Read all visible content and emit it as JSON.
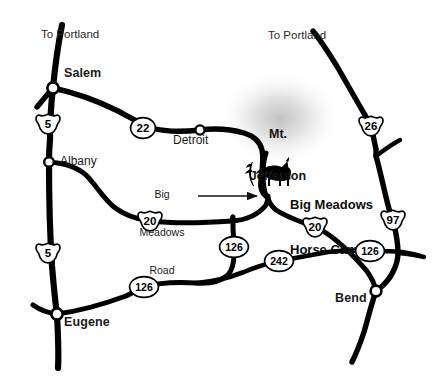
{
  "map": {
    "title": "Big Meadows Horse Camp vicinity map (Oregon)",
    "background_color": "#ffffff",
    "road_color": "#000000",
    "label_color": "#1a1a1a",
    "cities": [
      {
        "name": "Salem",
        "style": "major",
        "x": 81,
        "y": 72,
        "node_x": 53,
        "node_y": 88
      },
      {
        "name": "Albany",
        "style": "minor",
        "x": 60,
        "y": 159,
        "node_x": 49,
        "node_y": 162
      },
      {
        "name": "Eugene",
        "style": "major",
        "x": 64,
        "y": 319,
        "node_x": 57,
        "node_y": 314
      },
      {
        "name": "Detroit",
        "style": "minor",
        "x": 176,
        "y": 138,
        "node_x": 200,
        "node_y": 130
      },
      {
        "name": "Bend",
        "style": "major",
        "x": 337,
        "y": 295,
        "node_x": 376,
        "node_y": 291
      }
    ],
    "destinations": [
      {
        "label": "To Portland",
        "x": 41,
        "y": 28
      },
      {
        "label": "To Portland",
        "x": 268,
        "y": 29
      }
    ],
    "peaks": [
      {
        "label": "Mt.\nJefferson",
        "line1": "Mt.",
        "line2": "Jefferson",
        "x": 264,
        "y": 98
      }
    ],
    "annotations": [
      {
        "label": "Big\nMeadows\nRoad",
        "line1": "Big",
        "line2": "Meadows",
        "line3": "Road",
        "x": 158,
        "y": 165,
        "arrow_from_x": 205,
        "arrow_from_y": 196,
        "arrow_to_x": 258,
        "arrow_to_y": 196
      }
    ],
    "points_of_interest": [
      {
        "label": "Big Meadows\nHorse Camp",
        "line1": "Big Meadows",
        "line2": "Horse Camp",
        "icon": "horse-icon",
        "x": 285,
        "y": 172,
        "icon_x": 258,
        "icon_y": 170
      }
    ],
    "route_markers": [
      {
        "number": "5",
        "type": "interstate-shield",
        "x": 48,
        "y": 124
      },
      {
        "number": "5",
        "type": "interstate-shield",
        "x": 48,
        "y": 253
      },
      {
        "number": "22",
        "type": "circle",
        "x": 143,
        "y": 128
      },
      {
        "number": "20",
        "type": "us-shield",
        "x": 150,
        "y": 221
      },
      {
        "number": "126",
        "type": "circle",
        "x": 144,
        "y": 287
      },
      {
        "number": "126",
        "type": "circle",
        "x": 234,
        "y": 247
      },
      {
        "number": "242",
        "type": "circle",
        "x": 279,
        "y": 261
      },
      {
        "number": "20",
        "type": "us-shield",
        "x": 315,
        "y": 227
      },
      {
        "number": "126",
        "type": "circle",
        "x": 370,
        "y": 251
      },
      {
        "number": "26",
        "type": "us-shield",
        "x": 371,
        "y": 126
      },
      {
        "number": "97",
        "type": "us-shield",
        "x": 393,
        "y": 220
      }
    ]
  },
  "chart_data": {
    "type": "map",
    "region": "Central Oregon / Willamette Valley",
    "legend_position": "none",
    "grid": false,
    "nodes": [
      {
        "id": "salem",
        "label": "Salem",
        "x": 53,
        "y": 88
      },
      {
        "id": "albany",
        "label": "Albany",
        "x": 49,
        "y": 162
      },
      {
        "id": "eugene",
        "label": "Eugene",
        "x": 57,
        "y": 314
      },
      {
        "id": "detroit",
        "label": "Detroit",
        "x": 200,
        "y": 130
      },
      {
        "id": "bend",
        "label": "Bend",
        "x": 376,
        "y": 291
      },
      {
        "id": "camp",
        "label": "Big Meadows Horse Camp",
        "x": 268,
        "y": 186
      }
    ],
    "routes": [
      {
        "name": "I-5",
        "marker": "5",
        "shield": "interstate"
      },
      {
        "name": "OR-22",
        "marker": "22",
        "shield": "circle"
      },
      {
        "name": "US-20",
        "marker": "20",
        "shield": "us"
      },
      {
        "name": "OR-126",
        "marker": "126",
        "shield": "circle"
      },
      {
        "name": "OR-242",
        "marker": "242",
        "shield": "circle"
      },
      {
        "name": "US-26",
        "marker": "26",
        "shield": "us"
      },
      {
        "name": "US-97",
        "marker": "97",
        "shield": "us"
      }
    ]
  }
}
